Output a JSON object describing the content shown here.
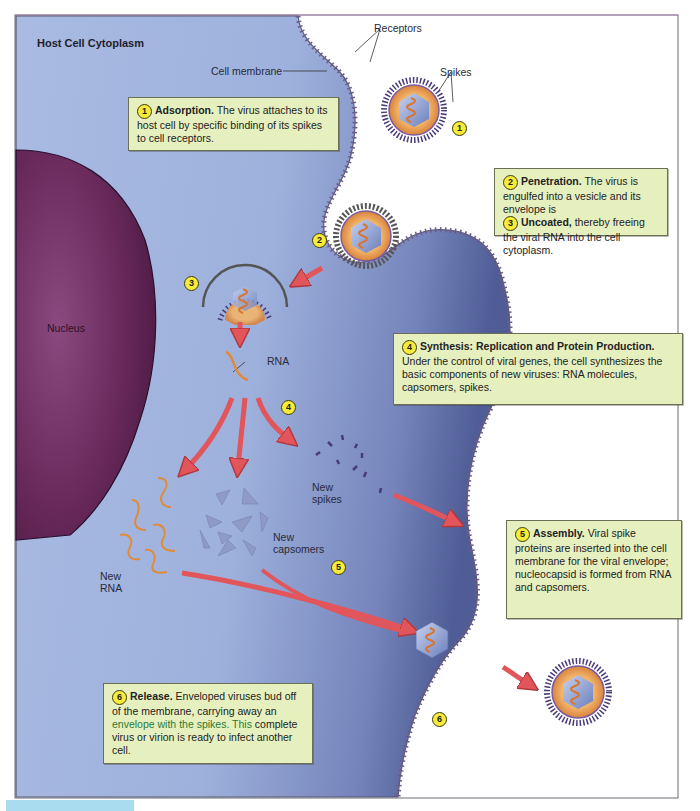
{
  "figure": {
    "title": "Host Cell Cytoplasm",
    "labels": {
      "cell_membrane": "Cell membrane",
      "receptors": "Receptors",
      "spikes": "Spikes",
      "nucleus": "Nucleus",
      "rna": "RNA",
      "new_spikes_line1": "New",
      "new_spikes_line2": "spikes",
      "new_capsomers_line1": "New",
      "new_capsomers_line2": "capsomers",
      "new_rna_line1": "New",
      "new_rna_line2": "RNA"
    },
    "step_markers": {
      "s1": "1",
      "s2": "2",
      "s3": "3",
      "s4": "4",
      "s5": "5",
      "s6": "6"
    },
    "steps": [
      {
        "number": "1",
        "heading": "Adsorption.",
        "text": "The virus attaches to its host cell by specific binding of its spikes to cell receptors."
      },
      {
        "number": "2",
        "heading": "Penetration.",
        "text": "The virus is engulfed into a vesicle and its envelope is"
      },
      {
        "number": "3",
        "heading": "Uncoated,",
        "text": "thereby freeing the viral RNA into the cell cytoplasm."
      },
      {
        "number": "4",
        "heading": "Synthesis: Replication and Protein Production.",
        "text": "Under the control of viral genes, the cell synthesizes the basic components of new viruses: RNA molecules, capsomers, spikes."
      },
      {
        "number": "5",
        "heading": "Assembly.",
        "text": "Viral spike proteins are inserted into the cell membrane for the viral envelope; nucleocapsid is formed from RNA and capsomers."
      },
      {
        "number": "6",
        "heading": "Release.",
        "text_a": "Enveloped viruses bud off of the membrane, carrying away an",
        "text_green": "envelope with the spikes. This",
        "text_b": "complete virus or virion is ready to infect another cell."
      }
    ],
    "colors": {
      "cytoplasm": "#9fb3dd",
      "cytoplasm_dark": "#5e6fa6",
      "nucleus": "#6b2a5e",
      "callout_bg": "#e6f0bf",
      "marker_yellow": "#f7ec3a",
      "arrow_red": "#e2555b",
      "rna_orange": "#e08a3a",
      "envelope_orange": "#ea9a4c",
      "capsid_blue": "#8f9fd0",
      "spike_purple": "#4a3a7a"
    }
  }
}
